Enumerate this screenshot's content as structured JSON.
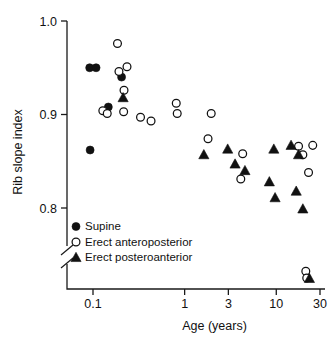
{
  "chart_data": {
    "type": "scatter",
    "title": "",
    "xlabel": "Age (years)",
    "ylabel": "Rib slope index",
    "xscale": "log",
    "yscale": "linear",
    "xlim": [
      0.07,
      33
    ],
    "ylim": [
      0.745,
      1.005
    ],
    "xticks": [
      0.1,
      1,
      3,
      10,
      30
    ],
    "xticklabels": [
      "0.1",
      "1",
      "3",
      "10",
      "30"
    ],
    "yticks": [
      0.8,
      0.9,
      1.0
    ],
    "yticklabels": [
      "0.8",
      "0.9",
      "1.0"
    ],
    "grid": false,
    "y_axis_break": true,
    "y_axis_break_note": "axis broken below 0.8 near 0.775",
    "legend_position": "lower-left",
    "marker_color": "#111111",
    "series": [
      {
        "name": "Supine",
        "marker": "filled-circle",
        "color": "#111111",
        "points": [
          {
            "x": 0.092,
            "y": 0.95
          },
          {
            "x": 0.108,
            "y": 0.95
          },
          {
            "x": 0.093,
            "y": 0.862
          },
          {
            "x": 0.147,
            "y": 0.908
          },
          {
            "x": 0.205,
            "y": 0.94
          }
        ]
      },
      {
        "name": "Erect anteroposterior",
        "marker": "open-circle",
        "color": "#111111",
        "points": [
          {
            "x": 0.185,
            "y": 0.976
          },
          {
            "x": 0.192,
            "y": 0.946
          },
          {
            "x": 0.235,
            "y": 0.951
          },
          {
            "x": 0.128,
            "y": 0.904
          },
          {
            "x": 0.143,
            "y": 0.901
          },
          {
            "x": 0.218,
            "y": 0.926
          },
          {
            "x": 0.216,
            "y": 0.903
          },
          {
            "x": 0.33,
            "y": 0.897
          },
          {
            "x": 0.43,
            "y": 0.893
          },
          {
            "x": 0.81,
            "y": 0.912
          },
          {
            "x": 0.83,
            "y": 0.901
          },
          {
            "x": 1.95,
            "y": 0.901
          },
          {
            "x": 1.8,
            "y": 0.874
          },
          {
            "x": 4.3,
            "y": 0.858
          },
          {
            "x": 4.1,
            "y": 0.831
          },
          {
            "x": 17.5,
            "y": 0.866
          },
          {
            "x": 25.0,
            "y": 0.867
          },
          {
            "x": 19.5,
            "y": 0.857
          },
          {
            "x": 22.5,
            "y": 0.838
          },
          {
            "x": 21.0,
            "y": 0.776
          },
          {
            "x": 21.5,
            "y": 0.758
          }
        ]
      },
      {
        "name": "Erect posteroanterior",
        "marker": "filled-triangle",
        "color": "#111111",
        "points": [
          {
            "x": 0.213,
            "y": 0.918
          },
          {
            "x": 1.62,
            "y": 0.857
          },
          {
            "x": 2.95,
            "y": 0.863
          },
          {
            "x": 3.55,
            "y": 0.847
          },
          {
            "x": 4.55,
            "y": 0.84
          },
          {
            "x": 9.4,
            "y": 0.863
          },
          {
            "x": 8.4,
            "y": 0.828
          },
          {
            "x": 9.7,
            "y": 0.811
          },
          {
            "x": 14.5,
            "y": 0.867
          },
          {
            "x": 17.5,
            "y": 0.857
          },
          {
            "x": 16.5,
            "y": 0.818
          },
          {
            "x": 19.5,
            "y": 0.799
          },
          {
            "x": 23.0,
            "y": 0.757
          }
        ]
      }
    ],
    "legend": [
      {
        "label": "Supine",
        "marker": "filled-circle"
      },
      {
        "label": "Erect anteroposterior",
        "marker": "open-circle"
      },
      {
        "label": "Erect posteroanterior",
        "marker": "filled-triangle"
      }
    ]
  }
}
